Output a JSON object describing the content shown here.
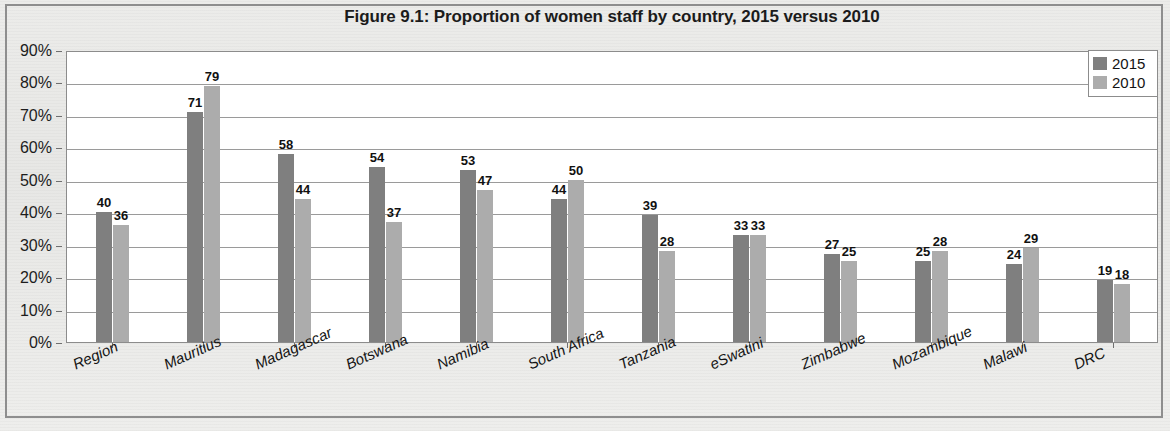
{
  "chart_data": {
    "type": "bar",
    "title": "Figure 9.1: Proportion of women staff by country, 2015 versus 2010",
    "xlabel": "",
    "ylabel": "",
    "ylim": [
      0,
      90
    ],
    "ytick_labels": [
      "90%",
      "80%",
      "70%",
      "60%",
      "50%",
      "40%",
      "30%",
      "20%",
      "10%",
      "0%"
    ],
    "ytick_values": [
      90,
      80,
      70,
      60,
      50,
      40,
      30,
      20,
      10,
      0
    ],
    "grid": true,
    "legend_position": "top-right",
    "categories": [
      "Region",
      "Mauritius",
      "Madagascar",
      "Botswana",
      "Namibia",
      "South Africa",
      "Tanzania",
      "eSwatini",
      "Zimbabwe",
      "Mozambique",
      "Malawi",
      "DRC"
    ],
    "series": [
      {
        "name": "2015",
        "color": "#7f7f7f",
        "values": [
          40,
          71,
          58,
          54,
          53,
          44,
          39,
          33,
          27,
          25,
          24,
          19
        ]
      },
      {
        "name": "2010",
        "color": "#acacac",
        "values": [
          36,
          79,
          44,
          37,
          47,
          50,
          28,
          33,
          25,
          28,
          29,
          18
        ]
      }
    ]
  },
  "legend": {
    "entries": [
      {
        "label": "2015",
        "color": "#7f7f7f"
      },
      {
        "label": "2010",
        "color": "#acacac"
      }
    ]
  }
}
